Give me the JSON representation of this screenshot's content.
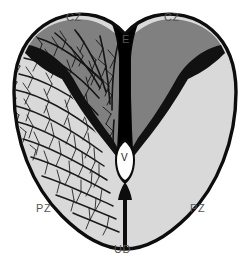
{
  "figure": {
    "background_color": "#ffffff",
    "outline_color": "#0d0d0d",
    "label_color": "#545454"
  },
  "zones": {
    "central_zone": {
      "abbr": "CZ",
      "name": "central zone",
      "fill": "#808080",
      "branch_color": "#141414"
    },
    "peripheral_zone": {
      "abbr": "PZ",
      "name": "peripheral zone",
      "fill": "#d9d9d9",
      "branch_color": "#1a1a1a"
    },
    "eminentia": {
      "abbr": "E",
      "name": "eminentia granularis groove",
      "fill": "#050505"
    },
    "ventricle": {
      "abbr": "V",
      "name": "ventricle",
      "fill": "#ffffff"
    },
    "midline": {
      "abbr": "UD",
      "name": "midline raphe",
      "fill": "#0d0d0d"
    }
  },
  "labels": [
    {
      "id": "cz-left",
      "text": "CZ",
      "x": 66,
      "y": 11
    },
    {
      "id": "cz-right",
      "text": "CZ",
      "x": 164,
      "y": 11
    },
    {
      "id": "e-top",
      "text": "E",
      "x": 122,
      "y": 33
    },
    {
      "id": "v-center",
      "text": "V",
      "x": 121,
      "y": 152
    },
    {
      "id": "pz-left",
      "text": "PZ",
      "x": 36,
      "y": 202
    },
    {
      "id": "pz-right",
      "text": "PZ",
      "x": 190,
      "y": 202
    },
    {
      "id": "ud-bottom",
      "text": "UD",
      "x": 114,
      "y": 243
    }
  ]
}
